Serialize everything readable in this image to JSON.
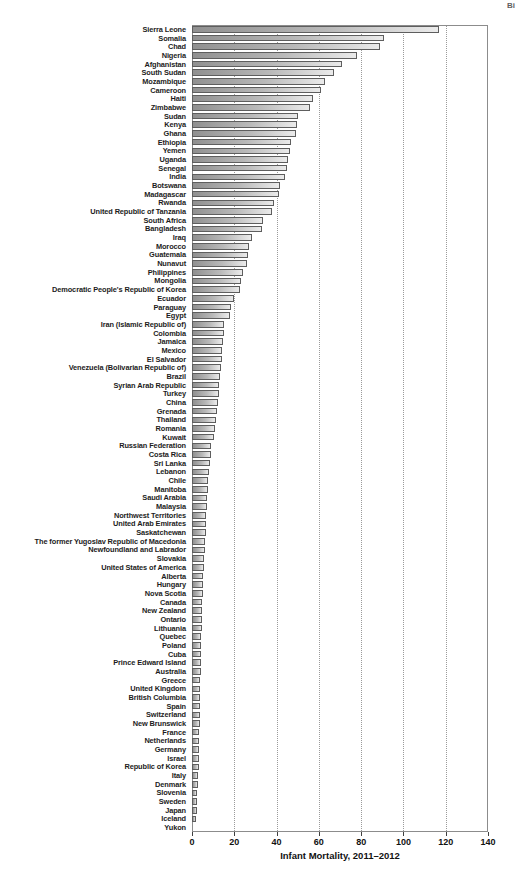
{
  "corner_text": "Bi",
  "chart_data": {
    "type": "bar",
    "orientation": "horizontal",
    "title": "",
    "xlabel": "Infant Mortality, 2011–2012",
    "ylabel": "",
    "xlim": [
      0,
      140
    ],
    "x_ticks": [
      0,
      20,
      40,
      60,
      80,
      100,
      120,
      140
    ],
    "x_tick_labels": [
      "0",
      "20",
      "40",
      "60",
      "80",
      "100",
      "120",
      "140"
    ],
    "grid": "dotted vertical gridlines every 20 units",
    "legend": "none",
    "bar_fill_gradient": [
      "#909090",
      "#ebebeb"
    ],
    "bar_border_color": "#5e5e5e",
    "frame_color": "#8c8c8c",
    "categories": [
      "Sierra Leone",
      "Somalia",
      "Chad",
      "Nigeria",
      "Afghanistan",
      "South Sudan",
      "Mozambique",
      "Cameroon",
      "Haiti",
      "Zimbabwe",
      "Sudan",
      "Kenya",
      "Ghana",
      "Ethiopia",
      "Yemen",
      "Uganda",
      "Senegal",
      "India",
      "Botswana",
      "Madagascar",
      "Rwanda",
      "United Republic of Tanzania",
      "South Africa",
      "Bangladesh",
      "Iraq",
      "Morocco",
      "Guatemala",
      "Nunavut",
      "Philippines",
      "Mongolia",
      "Democratic People's Republic of Korea",
      "Ecuador",
      "Paraguay",
      "Egypt",
      "Iran (Islamic Republic of)",
      "Colombia",
      "Jamaica",
      "Mexico",
      "El Salvador",
      "Venezuela (Bolivarian Republic of)",
      "Brazil",
      "Syrian Arab Republic",
      "Turkey",
      "China",
      "Grenada",
      "Thailand",
      "Romania",
      "Kuwait",
      "Russian Federation",
      "Costa Rica",
      "Sri Lanka",
      "Lebanon",
      "Chile",
      "Manitoba",
      "Saudi Arabia",
      "Malaysia",
      "Northwest Territories",
      "United Arab Emirates",
      "Saskatchewan",
      "The former Yugoslav Republic of Macedonia",
      "Newfoundland and Labrador",
      "Slovakia",
      "United States of America",
      "Alberta",
      "Hungary",
      "Nova Scotia",
      "Canada",
      "New Zealand",
      "Ontario",
      "Lithuania",
      "Quebec",
      "Poland",
      "Cuba",
      "Prince Edward Island",
      "Australia",
      "Greece",
      "United Kingdom",
      "British Columbia",
      "Spain",
      "Switzerland",
      "New Brunswick",
      "France",
      "Netherlands",
      "Germany",
      "Israel",
      "Republic of Korea",
      "Italy",
      "Denmark",
      "Slovenia",
      "Sweden",
      "Japan",
      "Iceland",
      "Yukon"
    ],
    "values": [
      117,
      91,
      89,
      78,
      71,
      67,
      63,
      61,
      57,
      56,
      50,
      49.5,
      49,
      47,
      46.5,
      45.5,
      45,
      44,
      41.5,
      41,
      39,
      38,
      33.5,
      33,
      28.5,
      27,
      26.5,
      26,
      24,
      23,
      22.5,
      20,
      18.5,
      18,
      15.2,
      15,
      14.6,
      14.4,
      14.2,
      13.6,
      13.2,
      12.8,
      12.6,
      12.2,
      11.8,
      11.4,
      11,
      10.2,
      9.2,
      8.8,
      8.4,
      8.1,
      7.8,
      7.5,
      7.2,
      7,
      6.8,
      6.6,
      6.5,
      6.2,
      6,
      5.8,
      5.6,
      5.2,
      5.1,
      5,
      4.8,
      4.7,
      4.6,
      4.5,
      4.4,
      4.3,
      4.3,
      4.2,
      4.1,
      4,
      4,
      4,
      3.9,
      3.8,
      3.7,
      3.5,
      3.4,
      3.3,
      3.2,
      3.1,
      3,
      2.9,
      2.5,
      2.4,
      2.2,
      1.8,
      0
    ]
  }
}
